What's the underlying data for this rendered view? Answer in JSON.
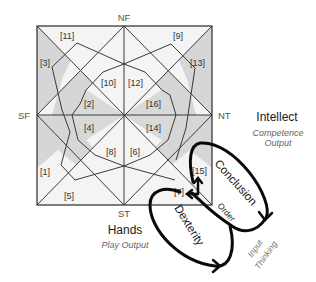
{
  "poles": {
    "top": "NF",
    "left": "SF",
    "right": "NT",
    "bottom": "ST"
  },
  "cells": [
    {
      "id": "11",
      "label": "[11]"
    },
    {
      "id": "9",
      "label": "[9]"
    },
    {
      "id": "3",
      "label": "[3]"
    },
    {
      "id": "13",
      "label": "[13]"
    },
    {
      "id": "10",
      "label": "[10]"
    },
    {
      "id": "12",
      "label": "[12]"
    },
    {
      "id": "2",
      "label": "[2]"
    },
    {
      "id": "16",
      "label": "[16]"
    },
    {
      "id": "4",
      "label": "[4]"
    },
    {
      "id": "14",
      "label": "[14]"
    },
    {
      "id": "8",
      "label": "[8]"
    },
    {
      "id": "6",
      "label": "[6]"
    },
    {
      "id": "1",
      "label": "[1]"
    },
    {
      "id": "15",
      "label": "[15]"
    },
    {
      "id": "5",
      "label": "[5]"
    },
    {
      "id": "7",
      "label": "[7]"
    }
  ],
  "intellect": {
    "title": "Intellect",
    "subtitle_line1": "Competence",
    "subtitle_line2": "Output"
  },
  "hands": {
    "title": "Hands",
    "subtitle": "Play Output"
  },
  "loops": {
    "conclusion": "Conclusion",
    "order": "Order",
    "dexterity": "Dexterity",
    "input": "Input",
    "thinking": "Thinking"
  },
  "colors": {
    "shaded_cell": "#d9d9d9",
    "light_cell": "#f4f4f4",
    "grid_line": "#3a3a3a",
    "loop_stroke": "#0a0a0a"
  }
}
